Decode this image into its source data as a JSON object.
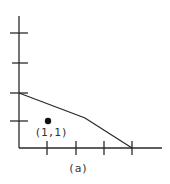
{
  "figure": {
    "caption": "(a)",
    "point_label": "(1,1)",
    "colors": {
      "ink": "#2a2a2a",
      "background": "#ffffff"
    }
  },
  "axes": {
    "x_ticks": [
      1,
      2,
      3,
      4
    ],
    "y_ticks": [
      1,
      2,
      3,
      4
    ],
    "x_range": [
      0,
      5
    ],
    "y_range": [
      0,
      4.5
    ]
  },
  "polyline": [
    [
      0,
      2
    ],
    [
      2.3,
      1.05
    ],
    [
      4,
      0
    ]
  ],
  "point": [
    1,
    1
  ]
}
